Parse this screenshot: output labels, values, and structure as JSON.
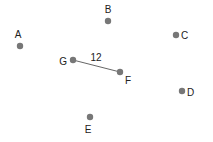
{
  "diagram": {
    "type": "graph",
    "node_color": "#777777",
    "edge_color": "#666666",
    "label_color": "#222222",
    "nodes": [
      {
        "id": "A",
        "label": "A",
        "x": 20,
        "y": 46,
        "lx": 18,
        "ly": 38,
        "anchor": "middle"
      },
      {
        "id": "B",
        "label": "B",
        "x": 108,
        "y": 21,
        "lx": 108,
        "ly": 13,
        "anchor": "middle"
      },
      {
        "id": "C",
        "label": "C",
        "x": 176,
        "y": 35,
        "lx": 181,
        "ly": 39,
        "anchor": "start"
      },
      {
        "id": "D",
        "label": "D",
        "x": 182,
        "y": 91,
        "lx": 187,
        "ly": 96,
        "anchor": "start"
      },
      {
        "id": "E",
        "label": "E",
        "x": 90,
        "y": 117,
        "lx": 88,
        "ly": 133,
        "anchor": "middle"
      },
      {
        "id": "F",
        "label": "F",
        "x": 120,
        "y": 72,
        "lx": 125,
        "ly": 84,
        "anchor": "start"
      },
      {
        "id": "G",
        "label": "G",
        "x": 73,
        "y": 60,
        "lx": 67,
        "ly": 65,
        "anchor": "end"
      }
    ],
    "edges": [
      {
        "from": "G",
        "to": "F",
        "weight": "12",
        "lx": 96,
        "ly": 61
      }
    ]
  }
}
